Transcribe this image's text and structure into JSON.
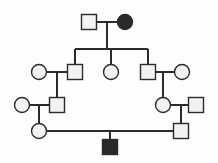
{
  "figure": {
    "kind": "pedigree-chart",
    "caption": "Four-generation pedigree: squares are males, circles are females, filled symbols are affected individuals.",
    "width": 218,
    "height": 163,
    "background_color": "#fdfdfd"
  },
  "style": {
    "line_color": "#2b2b2b",
    "line_width": 1.4,
    "symbol_stroke": "#2b2b2b",
    "symbol_stroke_width": 1.4,
    "unaffected_fill": "#f2f2f2",
    "affected_fill": "#2a2a2a",
    "square_size": 15,
    "circle_radius": 7.5
  },
  "legend": {
    "square_meaning": "male",
    "circle_meaning": "female",
    "filled_meaning": "affected",
    "open_meaning": "unaffected"
  },
  "generations": [
    {
      "id": "I",
      "label": "Generation I",
      "y": 22,
      "individuals": [
        {
          "id": "I-1",
          "name": "gen1-male-unaffected",
          "shape": "square",
          "sex": "male",
          "affected": false,
          "x": 89,
          "y": 22
        },
        {
          "id": "I-2",
          "name": "gen1-female-affected",
          "shape": "circle",
          "sex": "female",
          "affected": true,
          "x": 125,
          "y": 22
        }
      ]
    },
    {
      "id": "II",
      "label": "Generation II",
      "y": 72,
      "individuals": [
        {
          "id": "II-1",
          "name": "gen2-female-spouse-left",
          "shape": "circle",
          "sex": "female",
          "affected": false,
          "x": 39,
          "y": 72
        },
        {
          "id": "II-2",
          "name": "gen2-male-child-left",
          "shape": "square",
          "sex": "male",
          "affected": false,
          "x": 75,
          "y": 72
        },
        {
          "id": "II-3",
          "name": "gen2-female-child-middle",
          "shape": "circle",
          "sex": "female",
          "affected": false,
          "x": 111,
          "y": 72
        },
        {
          "id": "II-4",
          "name": "gen2-male-child-right",
          "shape": "square",
          "sex": "male",
          "affected": false,
          "x": 148,
          "y": 72
        },
        {
          "id": "II-5",
          "name": "gen2-female-spouse-right",
          "shape": "circle",
          "sex": "female",
          "affected": false,
          "x": 182,
          "y": 72
        }
      ]
    },
    {
      "id": "III",
      "label": "Generation III",
      "y": 105,
      "individuals": [
        {
          "id": "III-1",
          "name": "gen3-female-spouse-left",
          "shape": "circle",
          "sex": "female",
          "affected": false,
          "x": 22,
          "y": 105
        },
        {
          "id": "III-2",
          "name": "gen3-male-child-left",
          "shape": "square",
          "sex": "male",
          "affected": false,
          "x": 57,
          "y": 105
        },
        {
          "id": "III-3",
          "name": "gen3-female-child-right",
          "shape": "circle",
          "sex": "female",
          "affected": false,
          "x": 163,
          "y": 105
        },
        {
          "id": "III-4",
          "name": "gen3-male-spouse-right",
          "shape": "square",
          "sex": "male",
          "affected": false,
          "x": 196,
          "y": 105
        }
      ]
    },
    {
      "id": "IV",
      "label": "Generation IV",
      "y": 131,
      "individuals": [
        {
          "id": "IV-1",
          "name": "gen4-female-left",
          "shape": "circle",
          "sex": "female",
          "affected": false,
          "x": 39,
          "y": 131
        },
        {
          "id": "IV-2",
          "name": "gen4-male-right",
          "shape": "square",
          "sex": "male",
          "affected": false,
          "x": 181,
          "y": 131
        }
      ]
    },
    {
      "id": "V",
      "label": "Proband generation",
      "y": 147,
      "individuals": [
        {
          "id": "V-1",
          "name": "proband-male-affected",
          "shape": "square",
          "sex": "male",
          "affected": true,
          "x": 110,
          "y": 147
        }
      ]
    }
  ],
  "connections": [
    {
      "name": "mating-line-gen1",
      "type": "mating",
      "points": "96.5,22 117.5,22"
    },
    {
      "name": "descent-line-gen1",
      "type": "descent",
      "points": "107,22 107,49"
    },
    {
      "name": "sibship-line-gen2",
      "type": "sibship",
      "points": "75,49 148,49"
    },
    {
      "name": "drop-to-gen2-male-left",
      "type": "drop",
      "points": "75,49 75,64.5"
    },
    {
      "name": "drop-to-gen2-female-middle",
      "type": "drop",
      "points": "111,49 111,64.5"
    },
    {
      "name": "drop-to-gen2-male-right",
      "type": "drop",
      "points": "148,49 148,64.5"
    },
    {
      "name": "mating-line-gen2-left",
      "type": "mating",
      "points": "46.5,72 67.5,72"
    },
    {
      "name": "descent-line-gen2-left",
      "type": "descent",
      "points": "57,72 57,97.5"
    },
    {
      "name": "mating-line-gen2-right",
      "type": "mating",
      "points": "155.5,72 174.5,72"
    },
    {
      "name": "descent-line-gen2-right",
      "type": "descent",
      "points": "163,72 163,97.5"
    },
    {
      "name": "mating-line-gen3-left",
      "type": "mating",
      "points": "29.5,105 49.5,105"
    },
    {
      "name": "descent-line-gen3-left",
      "type": "descent",
      "points": "39,105 39,123.5"
    },
    {
      "name": "mating-line-gen3-right",
      "type": "mating",
      "points": "170.5,105 188.5,105"
    },
    {
      "name": "descent-line-gen3-right",
      "type": "descent",
      "points": "181,105 181,123.5"
    },
    {
      "name": "mating-line-gen4",
      "type": "mating",
      "points": "46.5,131 173.5,131"
    },
    {
      "name": "descent-line-proband",
      "type": "descent",
      "points": "110,131 110,139.5"
    }
  ]
}
